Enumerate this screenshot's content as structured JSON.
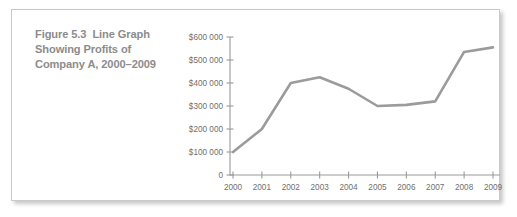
{
  "caption": {
    "label": "Figure 5.3",
    "text": "Line Graph Showing Profits of Company A, 2000–2009"
  },
  "colors": {
    "line": "#9b9b9b",
    "axis": "#9a9a9a",
    "tick_text": "#6f6f6f",
    "caption_text": "#8c8c8c",
    "panel_border": "#c9c9c9",
    "background": "#ffffff"
  },
  "chart_data": {
    "type": "line",
    "title": "Line Graph Showing Profits of Company A, 2000–2009",
    "xlabel": "",
    "ylabel": "",
    "grid": false,
    "legend": false,
    "categories": [
      "2000",
      "2001",
      "2002",
      "2003",
      "2004",
      "2005",
      "2006",
      "2007",
      "2008",
      "2009"
    ],
    "values": [
      100000,
      200000,
      400000,
      425000,
      375000,
      300000,
      305000,
      320000,
      535000,
      555000
    ],
    "ylim": [
      0,
      600000
    ],
    "ytick_values": [
      0,
      100000,
      200000,
      300000,
      400000,
      500000,
      600000
    ],
    "ytick_labels": [
      "0",
      "$100 000",
      "$200 000",
      "$300 000",
      "$400 000",
      "$500 000",
      "$600 000"
    ],
    "xtick_labels": [
      "2000",
      "2001",
      "2002",
      "2003",
      "2004",
      "2005",
      "2006",
      "2007",
      "2008",
      "2009"
    ]
  }
}
